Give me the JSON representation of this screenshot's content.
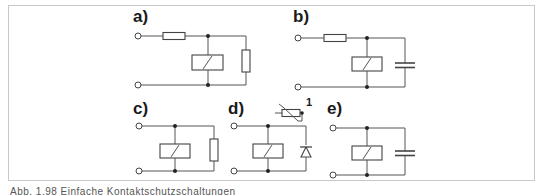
{
  "figure": {
    "caption": "Abb. 1.98 Einfache Kontaktschutzschaltungen",
    "frame_color": "#c8c8c8",
    "line_color": "#555555",
    "panels": [
      {
        "id": "a",
        "label": "a)",
        "components": [
          "series-resistor",
          "relay-coil",
          "parallel-resistor"
        ]
      },
      {
        "id": "b",
        "label": "b)",
        "components": [
          "series-resistor",
          "relay-coil",
          "parallel-capacitor"
        ]
      },
      {
        "id": "c",
        "label": "c)",
        "components": [
          "relay-coil",
          "parallel-resistor"
        ]
      },
      {
        "id": "d",
        "label": "d)",
        "components": [
          "relay-coil",
          "parallel-diode",
          "thermistor"
        ],
        "annotation": "1"
      },
      {
        "id": "e",
        "label": "e)",
        "components": [
          "relay-coil",
          "parallel-capacitor"
        ]
      }
    ]
  }
}
